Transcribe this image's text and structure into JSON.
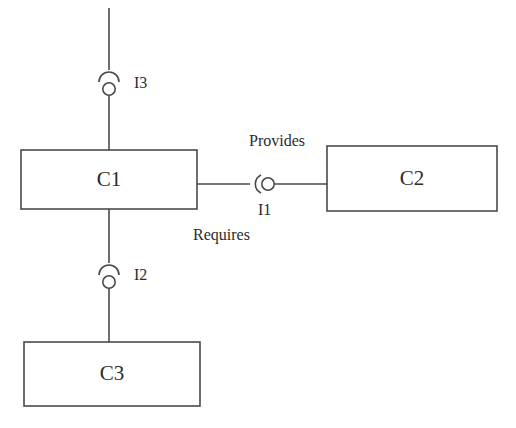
{
  "diagram": {
    "type": "uml-component-diagram",
    "background_color": "#ffffff",
    "stroke_color": "#4a4a4a",
    "text_color": "#2b2b2b"
  },
  "components": [
    {
      "id": "c1",
      "label": "C1",
      "x": 21,
      "y": 150,
      "width": 176,
      "height": 59,
      "center_x": 109,
      "center_y": 180
    },
    {
      "id": "c2",
      "label": "C2",
      "x": 327,
      "y": 146,
      "width": 170,
      "height": 65,
      "center_x": 412,
      "center_y": 179
    },
    {
      "id": "c3",
      "label": "C3",
      "x": 24,
      "y": 342,
      "width": 176,
      "height": 64,
      "center_x": 112,
      "center_y": 374
    }
  ],
  "interfaces": [
    {
      "id": "i3",
      "label": "I3",
      "label_x": 134,
      "label_y": 84,
      "symbol": "ball-and-socket",
      "orientation": "vertical",
      "socket_opens": "down",
      "socket_cx": 109,
      "socket_cy": 78,
      "ball_cx": 109,
      "ball_cy": 89,
      "ball_r": 6,
      "socket_r": 10,
      "connects": [
        "external-top",
        "c1"
      ]
    },
    {
      "id": "i1",
      "label": "I1",
      "label_x": 258,
      "label_y": 210,
      "symbol": "ball-and-socket",
      "orientation": "horizontal",
      "socket_opens": "right",
      "socket_cx": 258,
      "socket_cy": 184,
      "ball_cx": 268,
      "ball_cy": 184,
      "ball_r": 6,
      "socket_r": 10,
      "connects": [
        "c1",
        "c2"
      ]
    },
    {
      "id": "i2",
      "label": "I2",
      "label_x": 134,
      "label_y": 276,
      "symbol": "ball-and-socket",
      "orientation": "vertical",
      "socket_opens": "down",
      "socket_cx": 109,
      "socket_cy": 271,
      "ball_cx": 109,
      "ball_cy": 282,
      "ball_r": 6,
      "socket_r": 10,
      "connects": [
        "c1",
        "c3"
      ]
    }
  ],
  "annotations": [
    {
      "id": "provides",
      "text": "Provides",
      "x": 249,
      "y": 141,
      "anchor": "start",
      "describes": "i1"
    },
    {
      "id": "requires",
      "text": "Requires",
      "x": 193,
      "y": 235,
      "anchor": "start",
      "describes": "i1"
    }
  ],
  "connectors": [
    {
      "id": "top-stub",
      "from": "external-top",
      "to": "i3-socket",
      "x1": 109,
      "y1": 8,
      "x2": 109,
      "y2": 70
    },
    {
      "id": "i3-to-c1",
      "from": "i3-ball",
      "to": "c1-top",
      "x1": 109,
      "y1": 95,
      "x2": 109,
      "y2": 150
    },
    {
      "id": "c1-to-i1",
      "from": "c1-right",
      "to": "i1-socket",
      "x1": 197,
      "y1": 184,
      "x2": 250,
      "y2": 184
    },
    {
      "id": "i1-to-c2",
      "from": "i1-ball",
      "to": "c2-left",
      "x1": 274,
      "y1": 184,
      "x2": 327,
      "y2": 184
    },
    {
      "id": "c1-to-i2",
      "from": "c1-bottom",
      "to": "i2-socket",
      "x1": 109,
      "y1": 209,
      "x2": 109,
      "y2": 263
    },
    {
      "id": "i2-to-c3",
      "from": "i2-ball",
      "to": "c3-top",
      "x1": 109,
      "y1": 288,
      "x2": 109,
      "y2": 342
    }
  ]
}
